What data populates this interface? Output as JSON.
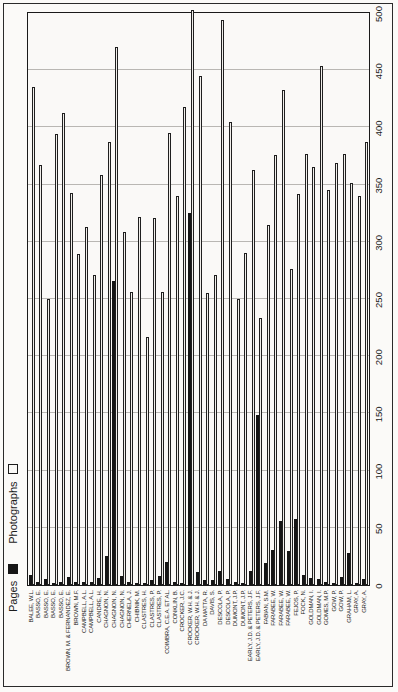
{
  "page": {
    "kind": "scanned bar chart page, chart rotated 90 degrees counterclockwise on portrait page",
    "background": "#fbfaf8",
    "border_color": "#2a2a2a"
  },
  "legend": {
    "pages_label": "Pages",
    "photographs_label": "Photographs",
    "pages_color": "#161616",
    "photographs_color": "#faf9f7"
  },
  "chart_data": {
    "type": "bar",
    "orientation": "horizontal bars in natural orientation; whole chart rotated -90deg on page",
    "title": "",
    "xlabel": "",
    "ylabel": "",
    "value_axis": {
      "min": 0,
      "max": 500,
      "step": 50,
      "ticks": [
        0,
        50,
        100,
        150,
        200,
        250,
        300,
        350,
        400,
        450,
        500
      ]
    },
    "grid": "vertical gridlines every 50",
    "legend_position": "top-left",
    "categories": [
      "BALEE, W.L.",
      "BASSO, E.",
      "BASSO, E.",
      "BASSO, E.",
      "BASSO, E.",
      "BROWN, M. & FERNANDEZ, E.",
      "BROWN, M.F.",
      "CAMPBELL, A.L.",
      "CAMPBELL, A.L.",
      "CANDRE, H.",
      "CHAGNON, N.",
      "CHAGNON, N.",
      "CHAGNON, N.",
      "CHERNELA, J.",
      "CHIBNIK, M.",
      "CLASTRES, H.",
      "CLASTRES, P.",
      "CLASTRES, P.",
      "COIMBRA, C.E.A. ET AL.",
      "CONKLIN, B.",
      "CROCKER, J.C.",
      "CROCKER, W.H. & J.",
      "CROCKER, W.H. & J.",
      "DA MATTA, R.",
      "DAVIS, S.",
      "DESCOLA, P.",
      "DESCOLA, P.",
      "DUMONT, J.P.",
      "DUMONT, J.P.",
      "EARLY, J.D. & PETERS, J.F.",
      "EARLY, J.D. & PETERS, J.F.",
      "FABIAN, S.M.",
      "FARABEE, W.",
      "FARABEE, W.",
      "FARABEE, W.",
      "FEJOS, P.",
      "FOCK, N.",
      "GOLDMAN, I.",
      "GOLDMAN, I.",
      "GOMES, M.P.",
      "GOW, P.",
      "GOW, P.",
      "GRAHAM, L.",
      "GRAY, A.",
      "GRAY, A."
    ],
    "series": [
      {
        "name": "Pages",
        "color": "#151515",
        "values": [
          9,
          3,
          5,
          2,
          3,
          7,
          3,
          3,
          3,
          6,
          25,
          266,
          8,
          3,
          2,
          2,
          4,
          8,
          20,
          3,
          2,
          325,
          11,
          4,
          4,
          12,
          5,
          3,
          2,
          12,
          149,
          19,
          31,
          56,
          30,
          58,
          9,
          6,
          5,
          3,
          2,
          7,
          28,
          2,
          5
        ]
      },
      {
        "name": "Photographs",
        "color": "#f1efeb",
        "values": [
          435,
          367,
          250,
          394,
          413,
          343,
          289,
          313,
          271,
          358,
          387,
          470,
          309,
          256,
          322,
          217,
          321,
          256,
          395,
          340,
          418,
          503,
          445,
          255,
          271,
          494,
          405,
          250,
          290,
          363,
          233,
          315,
          376,
          433,
          276,
          342,
          377,
          365,
          454,
          345,
          369,
          377,
          351,
          340,
          387
        ]
      }
    ]
  }
}
